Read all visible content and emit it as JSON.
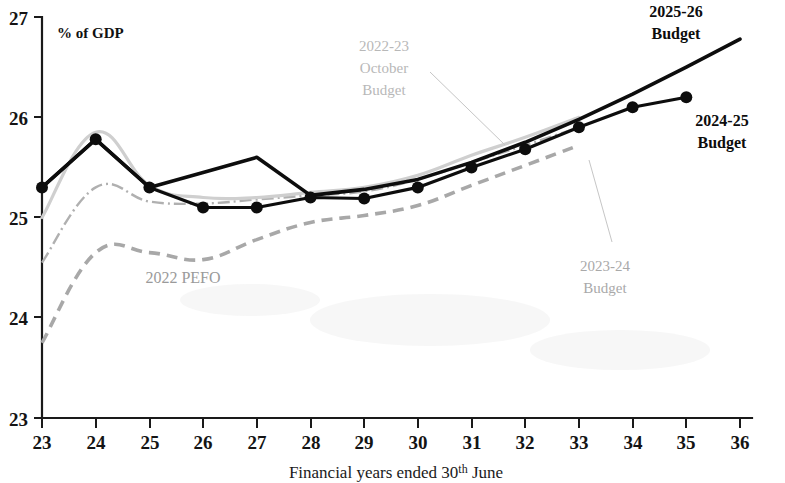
{
  "chart_data": {
    "type": "line",
    "title": "",
    "xlabel": "Financial years ended 30th June",
    "ylabel": "",
    "unit_label": "% of GDP",
    "xlim": [
      23,
      36
    ],
    "ylim": [
      23,
      27
    ],
    "grid": false,
    "legend_position": "inline-annotations",
    "x_tick_labels": [
      "23",
      "24",
      "25",
      "26",
      "27",
      "28",
      "29",
      "30",
      "31",
      "32",
      "33",
      "34",
      "35",
      "36"
    ],
    "y_tick_labels": [
      "23",
      "24",
      "25",
      "26",
      "27"
    ],
    "x_ticks": [
      23,
      24,
      25,
      26,
      27,
      28,
      29,
      30,
      31,
      32,
      33,
      34,
      35,
      36
    ],
    "y_ticks": [
      23,
      24,
      25,
      26,
      27
    ],
    "series": [
      {
        "name": "2025-26 Budget",
        "style": "solid-thick-black",
        "color": "#0d0d0d",
        "markers": false,
        "x": [
          23,
          24,
          25,
          26,
          27,
          28,
          29,
          30,
          31,
          32,
          33,
          34,
          35,
          36
        ],
        "values": [
          25.3,
          25.78,
          25.3,
          25.45,
          25.6,
          25.22,
          25.28,
          25.38,
          25.55,
          25.75,
          25.98,
          26.23,
          26.5,
          26.78
        ]
      },
      {
        "name": "2024-25 Budget",
        "style": "solid-thick-black-with-dots",
        "color": "#0d0d0d",
        "markers": true,
        "x": [
          23,
          24,
          25,
          26,
          27,
          28,
          29,
          30,
          31,
          32,
          33,
          34,
          35
        ],
        "values": [
          25.3,
          25.78,
          25.3,
          25.1,
          25.1,
          25.2,
          25.19,
          25.3,
          25.5,
          25.68,
          25.9,
          26.1,
          26.2
        ]
      },
      {
        "name": "2022-23 October Budget",
        "style": "solid-thin-lightgrey",
        "color": "#cfcfcf",
        "markers": false,
        "x": [
          23,
          24,
          25,
          26,
          27,
          28,
          29,
          30,
          31,
          32,
          33
        ],
        "values": [
          25.0,
          25.85,
          25.32,
          25.2,
          25.2,
          25.25,
          25.3,
          25.42,
          25.62,
          25.8,
          26.0
        ]
      },
      {
        "name": "2023-24 Budget",
        "style": "dash-dot-grey",
        "color": "#b0b0b0",
        "markers": false,
        "x": [
          23,
          24,
          25,
          26,
          27,
          28,
          29,
          30,
          31,
          32,
          33
        ],
        "values": [
          24.55,
          25.3,
          25.16,
          25.14,
          25.18,
          25.22,
          25.26,
          25.38,
          25.55,
          25.72,
          25.9
        ]
      },
      {
        "name": "2022 PEFO",
        "style": "dashed-grey",
        "color": "#a8a8a8",
        "markers": false,
        "x": [
          23,
          24,
          25,
          26,
          27,
          28,
          29,
          30,
          31,
          32,
          33
        ],
        "values": [
          23.75,
          24.65,
          24.65,
          24.58,
          24.78,
          24.95,
          25.02,
          25.12,
          25.32,
          25.52,
          25.72
        ]
      }
    ],
    "annotations": [
      {
        "id": "label-2025-26-budget",
        "text_lines": [
          "2025-26",
          "Budget"
        ],
        "style": "dark",
        "x_px": 676,
        "y_px": 17
      },
      {
        "id": "label-2024-25-budget",
        "text_lines": [
          "2024-25",
          "Budget"
        ],
        "style": "dark",
        "x_px": 722,
        "y_px": 126
      },
      {
        "id": "label-2022-23-october-budget",
        "text_lines": [
          "2022-23",
          "October",
          "Budget"
        ],
        "style": "light-grey",
        "x_px": 384,
        "y_px": 45
      },
      {
        "id": "label-2023-24-budget",
        "text_lines": [
          "2023-24",
          "Budget"
        ],
        "style": "light-grey",
        "x_px": 605,
        "y_px": 265
      },
      {
        "id": "label-2022-pefo",
        "text_lines": [
          "2022 PEFO"
        ],
        "style": "grey",
        "x_px": 183,
        "y_px": 277
      }
    ]
  }
}
